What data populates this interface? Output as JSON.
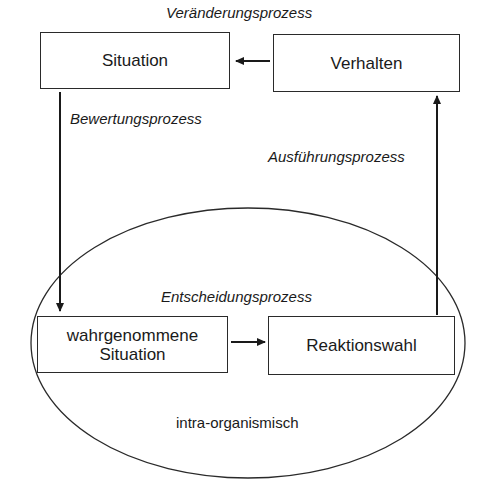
{
  "diagram": {
    "nodes": {
      "situation": "Situation",
      "verhalten": "Verhalten",
      "wahrgenommene_situation_line1": "wahrgenommene",
      "wahrgenommene_situation_line2": "Situation",
      "reaktionswahl": "Reaktionswahl"
    },
    "processes": {
      "veraenderung": "Veränderungsprozess",
      "bewertung": "Bewertungsprozess",
      "ausfuehrung": "Ausführungsprozess",
      "entscheidung": "Entscheidungsprozess"
    },
    "region_label": "intra-organismisch",
    "edges": [
      {
        "from": "Verhalten",
        "to": "Situation",
        "label": "Veränderungsprozess"
      },
      {
        "from": "Situation",
        "to": "wahrgenommene Situation",
        "label": "Bewertungsprozess"
      },
      {
        "from": "wahrgenommene Situation",
        "to": "Reaktionswahl",
        "label": "Entscheidungsprozess"
      },
      {
        "from": "Reaktionswahl",
        "to": "Verhalten",
        "label": "Ausführungsprozess"
      }
    ]
  }
}
